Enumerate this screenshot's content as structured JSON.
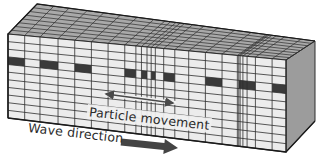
{
  "diagram": {
    "labels": {
      "particle_movement": "Particle movement",
      "wave_direction": "Wave direction"
    },
    "colors": {
      "front_face": "#ececec",
      "top_face": "#a9a9a9",
      "side_face": "#9c9c9c",
      "grid_line": "#2e2e2e",
      "marker": "#3a3a3a",
      "arrow": "#4a4a4a",
      "text": "#2b2b2b"
    },
    "geometry": {
      "front": {
        "tl": [
          8,
          34
        ],
        "tr": [
          286,
          60
        ],
        "br": [
          286,
          152
        ],
        "bl": [
          8,
          118
        ]
      },
      "back": {
        "tl": [
          37,
          4
        ],
        "tr": [
          315,
          41
        ]
      },
      "side_bottom": [
        315,
        121
      ]
    },
    "grid": {
      "columns_t": [
        0,
        0.06,
        0.115,
        0.18,
        0.24,
        0.3,
        0.36,
        0.42,
        0.46,
        0.48,
        0.5,
        0.515,
        0.53,
        0.56,
        0.6,
        0.65,
        0.71,
        0.77,
        0.83,
        0.89,
        0.95,
        1
      ],
      "extra_compression_t": [
        0.825,
        0.835,
        0.845,
        0.86
      ],
      "rows": 11,
      "top_rows": 8,
      "marker_row": 3,
      "marker_columns": [
        0,
        2,
        4,
        7,
        9,
        11,
        13,
        16,
        18,
        20
      ]
    },
    "particle_arrow": {
      "x1": 103,
      "y1": 94,
      "x2": 176,
      "y2": 103
    },
    "wave_arrow": {
      "x1": 121,
      "y1": 142,
      "x2": 178,
      "y2": 148
    }
  }
}
